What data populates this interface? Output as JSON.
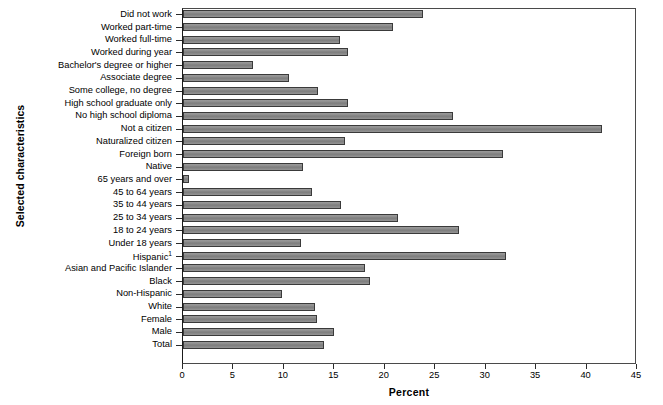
{
  "chart_data": {
    "type": "bar",
    "orientation": "horizontal",
    "title": "",
    "xlabel": "Percent",
    "ylabel": "Selected characteristics",
    "xlim": [
      0,
      45
    ],
    "xticks": [
      0,
      5,
      10,
      15,
      20,
      25,
      30,
      35,
      40,
      45
    ],
    "grid": false,
    "legend": null,
    "bar_color": "#8a8a8a",
    "bar_edge_color": "#3a3a3a",
    "categories": [
      "Did not work",
      "Worked part-time",
      "Worked full-time",
      "Worked during year",
      "Bachelor's degree or higher",
      "Associate degree",
      "Some college, no degree",
      "High school graduate only",
      "No high school diploma",
      "Not a citizen",
      "Naturalized citizen",
      "Foreign born",
      "Native",
      "65 years and over",
      "45 to 64 years",
      "35 to 44 years",
      "25 to 34 years",
      "18 to 24 years",
      "Under 18 years",
      "Hispanic",
      "Asian and Pacific Islander",
      "Black",
      "Non-Hispanic",
      "White",
      "Female",
      "Male",
      "Total"
    ],
    "category_footnotes": {
      "Hispanic": "1"
    },
    "values": [
      23.8,
      20.8,
      15.6,
      16.4,
      6.9,
      10.5,
      13.4,
      16.4,
      26.8,
      41.5,
      16.1,
      31.7,
      11.9,
      0.6,
      12.8,
      15.7,
      21.3,
      27.4,
      11.7,
      32.0,
      18.0,
      18.5,
      9.8,
      13.1,
      13.3,
      15.0,
      14.0
    ]
  }
}
